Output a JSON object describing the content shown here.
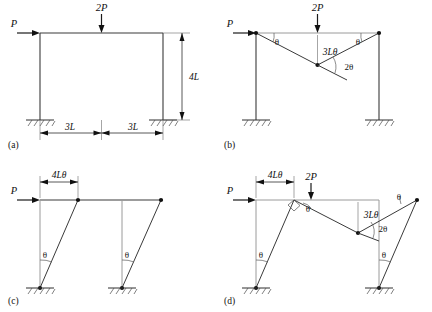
{
  "figure": {
    "width": 432,
    "height": 312,
    "background": "#ffffff",
    "line_color": "#3a3a3a",
    "ghost_color": "#9a9a9a",
    "hinge_color": "#111111"
  },
  "panels": [
    {
      "id": "a",
      "label": "(a)",
      "caption": "Portal frame geometry and loading",
      "loads": [
        {
          "name": "horizontal-load",
          "label": "P",
          "direction": "right"
        },
        {
          "name": "vertical-load",
          "label": "2P",
          "direction": "down"
        }
      ],
      "dimensions": [
        {
          "name": "span-left",
          "label": "3L",
          "orientation": "horizontal"
        },
        {
          "name": "span-right",
          "label": "3L",
          "orientation": "horizontal"
        },
        {
          "name": "height",
          "label": "4L",
          "orientation": "vertical"
        }
      ],
      "supports": 2,
      "support_type": "fixed"
    },
    {
      "id": "b",
      "label": "(b)",
      "caption": "Beam mechanism",
      "loads": [
        {
          "name": "horizontal-load",
          "label": "P",
          "direction": "right"
        },
        {
          "name": "vertical-load",
          "label": "2P",
          "direction": "down"
        }
      ],
      "angles": [
        {
          "name": "angle-left",
          "label": "θ"
        },
        {
          "name": "angle-right",
          "label": "θ"
        },
        {
          "name": "angle-apex",
          "label": "2θ"
        }
      ],
      "displacements": [
        {
          "name": "midspan-deflection",
          "label": "3Lθ"
        }
      ],
      "hinges": 3,
      "supports": 2,
      "support_type": "fixed"
    },
    {
      "id": "c",
      "label": "(c)",
      "caption": "Sway mechanism",
      "loads": [
        {
          "name": "horizontal-load",
          "label": "P",
          "direction": "right"
        }
      ],
      "angles": [
        {
          "name": "angle-left-column",
          "label": "θ"
        },
        {
          "name": "angle-right-column",
          "label": "θ"
        }
      ],
      "displacements": [
        {
          "name": "sway-displacement",
          "label": "4Lθ"
        }
      ],
      "hinges": 4,
      "supports": 2,
      "support_type": "fixed"
    },
    {
      "id": "d",
      "label": "(d)",
      "caption": "Combined mechanism",
      "loads": [
        {
          "name": "horizontal-load",
          "label": "P",
          "direction": "right"
        },
        {
          "name": "vertical-load",
          "label": "2P",
          "direction": "down"
        }
      ],
      "angles": [
        {
          "name": "angle-left-column",
          "label": "θ"
        },
        {
          "name": "angle-beam-left",
          "label": "θ"
        },
        {
          "name": "angle-beam-right",
          "label": "θ"
        },
        {
          "name": "angle-apex",
          "label": "2θ"
        },
        {
          "name": "angle-right-column",
          "label": "θ"
        }
      ],
      "displacements": [
        {
          "name": "sway-displacement",
          "label": "4Lθ"
        },
        {
          "name": "midspan-deflection",
          "label": "3Lθ"
        }
      ],
      "right_angle_marker": true,
      "hinges": 4,
      "supports": 2,
      "support_type": "fixed"
    }
  ]
}
